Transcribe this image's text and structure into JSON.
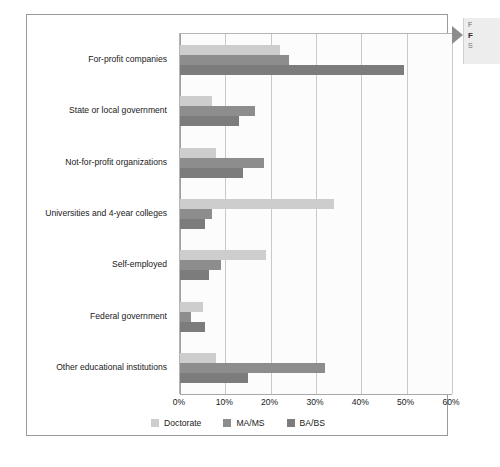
{
  "chart_data": {
    "type": "bar",
    "orientation": "horizontal",
    "title": "",
    "subtitle": "",
    "xlabel": "",
    "ylabel": "",
    "xlim": [
      0,
      60
    ],
    "xticks": [
      "0%",
      "10%",
      "20%",
      "30%",
      "40%",
      "50%",
      "60%"
    ],
    "xtick_values": [
      0,
      10,
      20,
      30,
      40,
      50,
      60
    ],
    "grid": true,
    "legend_position": "bottom-center",
    "categories": [
      "For-profit companies",
      "State or local government",
      "Not-for-profit organizations",
      "Universities and 4-year colleges",
      "Self-employed",
      "Federal government",
      "Other educational institutions"
    ],
    "series": [
      {
        "name": "Doctorate",
        "color": "#cdcdcd",
        "values": [
          22,
          7,
          8,
          34,
          19,
          5,
          8
        ]
      },
      {
        "name": "MA/MS",
        "color": "#8d8d8d",
        "values": [
          24,
          16.5,
          18.5,
          7,
          9,
          2.5,
          32
        ]
      },
      {
        "name": "BA/BS",
        "color": "#7c7c7c",
        "values": [
          49.5,
          13,
          14,
          5.5,
          6.5,
          5.5,
          15
        ]
      }
    ]
  },
  "legend": {
    "items": [
      {
        "label": "Doctorate",
        "color": "#cdcdcd"
      },
      {
        "label": "MA/MS",
        "color": "#8d8d8d"
      },
      {
        "label": "BA/BS",
        "color": "#7c7c7c"
      }
    ]
  },
  "callout": {
    "line1": "F",
    "line2": "F",
    "line3": "S"
  }
}
